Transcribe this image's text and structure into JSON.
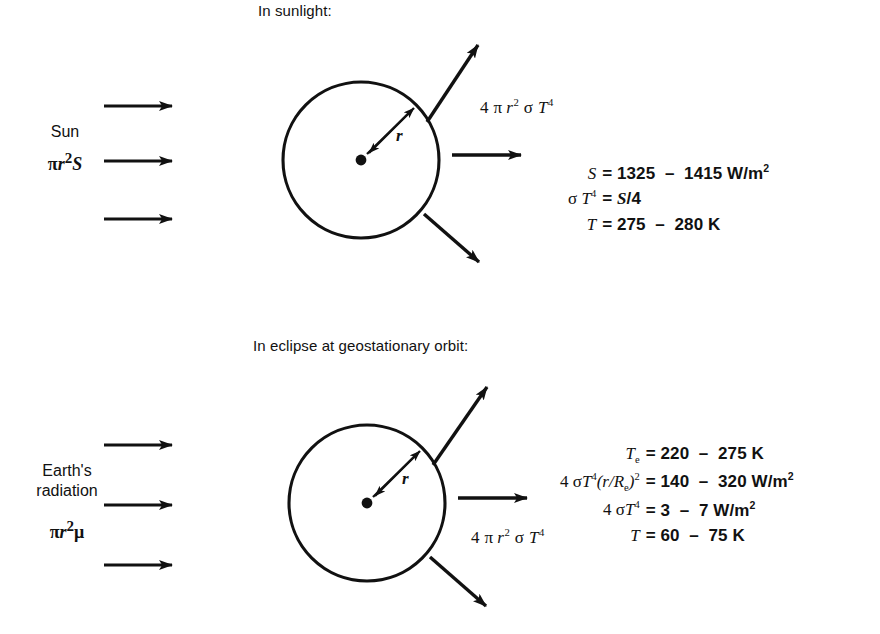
{
  "figure": {
    "background_color": "#ffffff",
    "ink_color": "#111111",
    "panels": [
      {
        "id": "sunlight",
        "title": "In sunlight:",
        "incoming": {
          "label_line1": "Sun",
          "label_line2_math": "πr²S",
          "arrow_count": 3
        },
        "body": {
          "radius_label": "r",
          "shape": "circle"
        },
        "emitted_label": "4 π r² σ T⁴",
        "equations": [
          {
            "lhs": "S",
            "rhs": "= 1325 − 1415 W/m²"
          },
          {
            "lhs": "σ T⁴",
            "rhs": "= S/4"
          },
          {
            "lhs": "T",
            "rhs": "= 275 − 280 K"
          }
        ]
      },
      {
        "id": "eclipse",
        "title": "In eclipse at geostationary orbit:",
        "incoming": {
          "label_line1": "Earth's",
          "label_line2": "radiation",
          "label_line3_math": "πr²μ",
          "arrow_count": 3
        },
        "body": {
          "radius_label": "r",
          "shape": "circle"
        },
        "emitted_label": "4 π r² σ T⁴",
        "equations": [
          {
            "lhs": "Tₑ",
            "rhs": "= 220 − 275 K"
          },
          {
            "lhs": "4 σ T⁴(r/Rₑ)²",
            "rhs": "= 140 − 320 W/m²"
          },
          {
            "lhs": "4 σ T⁴",
            "rhs": "= 3 − 7 W/m²"
          },
          {
            "lhs": "T",
            "rhs": "= 60 − 75 K"
          }
        ]
      }
    ],
    "caption_fragment": "Figure caption (cropped at page edge)"
  }
}
